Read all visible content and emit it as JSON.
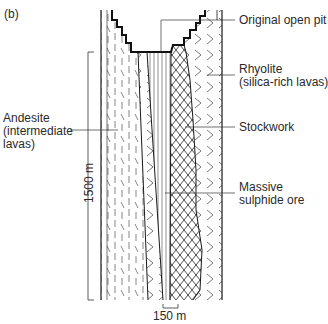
{
  "figure": {
    "panel_label": "(b)",
    "labels": {
      "original_open_pit": "Original open pit",
      "rhyolite_line1": "Rhyolite",
      "rhyolite_line2": "(silica-rich lavas)",
      "andesite_line1": "Andesite",
      "andesite_line2": "(intermediate",
      "andesite_line3": "lavas)",
      "stockwork": "Stockwork",
      "massive_line1": "Massive",
      "massive_line2": "sulphide ore"
    },
    "scale": {
      "vertical": "1500 m",
      "horizontal": "150 m"
    },
    "colors": {
      "line": "#1a1a1a",
      "pattern": "#555555",
      "background": "#ffffff"
    }
  }
}
